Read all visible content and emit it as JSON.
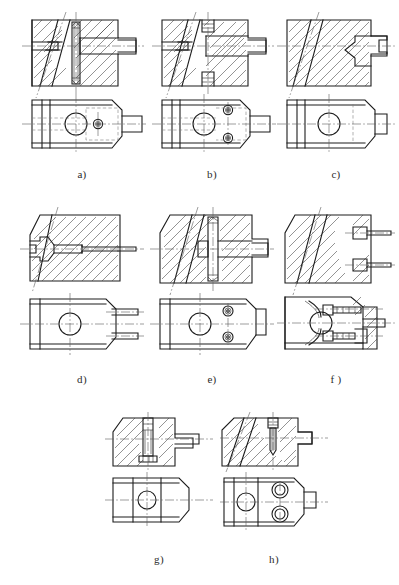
{
  "sheet": {
    "title": "Clamping element variants — sectional and plan views",
    "background_color": "#ffffff",
    "line_color": "#1c1c1c",
    "center_line_color": "#5a5a5a",
    "hidden_line_color": "#7d7d7d",
    "hatch_color": "#3a3a3a",
    "columns": 3,
    "rows": 3,
    "figure_count": 8
  },
  "figures": [
    {
      "id": "a",
      "label": "a)",
      "row": 1,
      "column": 1,
      "views": [
        "section-front-view",
        "plan-view"
      ],
      "description": "Sectioned body with inclined slot, vertical pin through body, stepped shaft on right; plan view with large through hole and small screw head",
      "features": {
        "hatching": true,
        "inclined_slot": true,
        "vertical_pin": true,
        "stepped_shaft": true,
        "plan_large_hole": true,
        "plan_small_holes": 1,
        "hidden_outline_box": true,
        "chamfered_corner": true
      }
    },
    {
      "id": "b",
      "label": "b)",
      "row": 1,
      "column": 2,
      "views": [
        "section-front-view",
        "plan-view"
      ],
      "description": "Sectioned body with inclined slot, two counterbored screws top and bottom, stepped shaft on right; plan view with large hole and two screw heads",
      "features": {
        "hatching": true,
        "inclined_slot": true,
        "vertical_pin": false,
        "stepped_shaft": true,
        "plan_large_hole": true,
        "plan_small_holes": 2,
        "hidden_outline_box": true,
        "chamfered_corner": true
      }
    },
    {
      "id": "c",
      "label": "c)",
      "row": 1,
      "column": 3,
      "views": [
        "section-front-view",
        "plan-view"
      ],
      "description": "Sectioned body with inclined slot and T-shaped tenon projecting right; plan view with large hole and stepped boss",
      "features": {
        "hatching": true,
        "inclined_slot": true,
        "vertical_pin": false,
        "stepped_shaft": true,
        "plan_large_hole": true,
        "plan_small_holes": 0,
        "hidden_outline_box": true,
        "chamfered_corner": true
      }
    },
    {
      "id": "d",
      "label": "d)",
      "row": 2,
      "column": 1,
      "views": [
        "section-front-view",
        "plan-view"
      ],
      "description": "Sectioned body with tapered bore and long rod extending right; plan view with large hole and two parallel prongs",
      "features": {
        "hatching": true,
        "inclined_slot": true,
        "vertical_pin": false,
        "stepped_shaft": true,
        "plan_large_hole": true,
        "plan_small_holes": 0,
        "prongs": 2,
        "chamfered_corner": true
      }
    },
    {
      "id": "e",
      "label": "e)",
      "row": 2,
      "column": 2,
      "views": [
        "section-front-view",
        "plan-view"
      ],
      "description": "Sectioned body with inclined slot, vertical pin and square block, stepped shaft right; plan view with large hole and two socket screws",
      "features": {
        "hatching": true,
        "inclined_slot": true,
        "vertical_pin": true,
        "stepped_shaft": true,
        "plan_large_hole": true,
        "plan_small_holes": 2,
        "chamfered_corner": true
      }
    },
    {
      "id": "f",
      "label": "f )",
      "row": 2,
      "column": 3,
      "views": [
        "section-front-view",
        "plan-view"
      ],
      "description": "Sectioned body with inclined slot and two horizontal pins at right; plan view sectioned showing ball, two screws and central spigot",
      "features": {
        "hatching": true,
        "inclined_slot": true,
        "vertical_pin": false,
        "stepped_shaft": true,
        "plan_large_hole": true,
        "plan_small_holes": 2,
        "prongs": 2,
        "chamfered_corner": true
      }
    },
    {
      "id": "g",
      "label": "g)",
      "row": 3,
      "column": 1,
      "views": [
        "section-front-view",
        "plan-view"
      ],
      "description": "Sectioned body with vertical set screw in centre and side tenon; plan view with large hole and two vertical division lines",
      "features": {
        "hatching": true,
        "inclined_slot": false,
        "vertical_pin": true,
        "stepped_shaft": true,
        "plan_large_hole": true,
        "plan_small_holes": 0,
        "chamfered_corner": true
      }
    },
    {
      "id": "h",
      "label": "h)",
      "row": 3,
      "column": 2,
      "views": [
        "section-front-view",
        "plan-view"
      ],
      "description": "Sectioned body with inclined slot and vertical pointed set screw; plan view with large hole and two counterbored holes, small boss right",
      "features": {
        "hatching": true,
        "inclined_slot": true,
        "vertical_pin": true,
        "stepped_shaft": true,
        "plan_large_hole": true,
        "plan_small_holes": 2,
        "chamfered_corner": true
      }
    }
  ]
}
